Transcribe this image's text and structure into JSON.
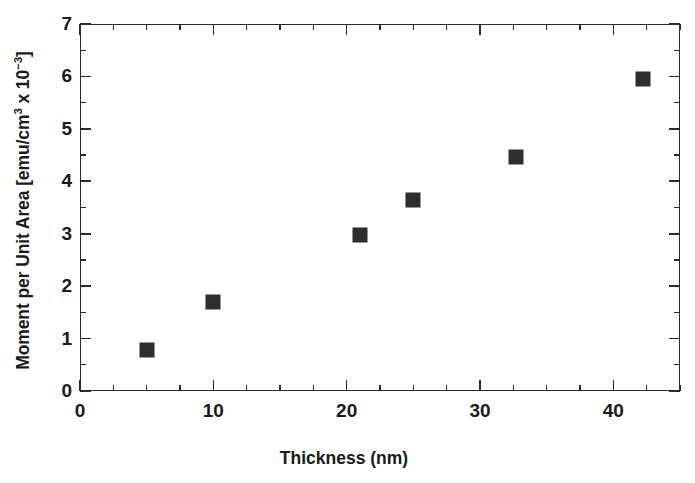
{
  "chart_data": {
    "type": "scatter",
    "title": "",
    "xlabel": "Thickness (nm)",
    "ylabel": "Moment per Unit Area [emu/cm3 x 10-3]",
    "ylabel_prefix": "Moment per Unit Area [emu/cm",
    "ylabel_sup1": "3",
    "ylabel_mid": " x 10",
    "ylabel_sup2": "−3",
    "ylabel_suffix": "]",
    "xlim": [
      0,
      45
    ],
    "ylim": [
      0,
      7
    ],
    "xticks": [
      0,
      10,
      20,
      30,
      40
    ],
    "xtick_labels": [
      "0",
      "10",
      "20",
      "30",
      "40"
    ],
    "xminor_step": 2.5,
    "yticks": [
      0,
      1,
      2,
      3,
      4,
      5,
      6,
      7
    ],
    "ytick_labels": [
      "0",
      "1",
      "2",
      "3",
      "4",
      "5",
      "6",
      "7"
    ],
    "yminor_step": 0.5,
    "grid": false,
    "legend": null,
    "marker": "filled-square",
    "marker_color": "#2e2e2e",
    "series": [
      {
        "name": "Moment per unit area",
        "points": [
          {
            "x": 5.0,
            "y": 0.78
          },
          {
            "x": 10.0,
            "y": 1.7
          },
          {
            "x": 21.0,
            "y": 2.97
          },
          {
            "x": 25.0,
            "y": 3.65
          },
          {
            "x": 32.7,
            "y": 4.47
          },
          {
            "x": 42.2,
            "y": 5.95
          }
        ]
      }
    ]
  }
}
